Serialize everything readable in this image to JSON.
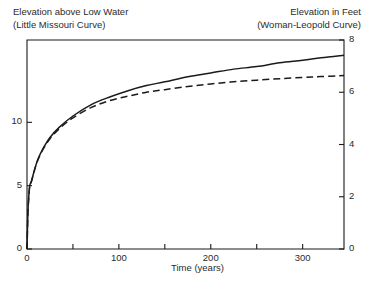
{
  "chart_data": {
    "type": "line",
    "title": "",
    "left_axis_title": "Elevation above Low Water\n(Little Missouri Curve)",
    "right_axis_title": "Elevation in Feet\n(Woman-Leopold Curve)",
    "xlabel": "Time (years)",
    "ylabel_left": "Elevation above Low Water",
    "ylabel_right": "Elevation in Feet",
    "grid": false,
    "legend": "none",
    "xlim": [
      0,
      345
    ],
    "ylim_left": [
      0,
      16.5
    ],
    "ylim_right": [
      0,
      8
    ],
    "xticks": [
      0,
      50,
      100,
      150,
      200,
      250,
      300
    ],
    "xtick_labels": [
      "0",
      "",
      "100",
      "",
      "200",
      "",
      "300"
    ],
    "yticks_left": [
      0,
      5,
      10
    ],
    "ytick_labels_left": [
      "0",
      "5",
      "10"
    ],
    "yticks_right": [
      0,
      2,
      4,
      6,
      8
    ],
    "ytick_labels_right": [
      "0",
      "2",
      "4",
      "6",
      "8"
    ],
    "series": [
      {
        "name": "Little Missouri Curve",
        "style": "solid",
        "axis": "left",
        "x": [
          0,
          1,
          2,
          3,
          5,
          8,
          12,
          18,
          25,
          35,
          50,
          70,
          90,
          110,
          130,
          150,
          175,
          200,
          225,
          250,
          275,
          300,
          320,
          345
        ],
        "values": [
          0,
          2.9,
          4.2,
          5.0,
          5.4,
          6.2,
          7.1,
          8.0,
          8.8,
          9.6,
          10.5,
          11.4,
          12.0,
          12.5,
          12.9,
          13.2,
          13.6,
          13.9,
          14.2,
          14.4,
          14.7,
          14.9,
          15.1,
          15.3
        ]
      },
      {
        "name": "Woman-Leopold Curve",
        "style": "dashed",
        "axis": "right",
        "x": [
          0,
          1,
          2,
          3,
          5,
          8,
          12,
          18,
          25,
          35,
          50,
          70,
          90,
          110,
          130,
          150,
          175,
          200,
          225,
          250,
          275,
          300,
          320,
          345
        ],
        "values": [
          0,
          1.38,
          2.0,
          2.4,
          2.6,
          3.0,
          3.42,
          3.85,
          4.22,
          4.6,
          5.02,
          5.42,
          5.68,
          5.85,
          6.0,
          6.1,
          6.22,
          6.32,
          6.4,
          6.46,
          6.52,
          6.57,
          6.6,
          6.64
        ]
      }
    ],
    "colors": {
      "axis": "#1a1a1a",
      "series_solid": "#1a1a1a",
      "series_dashed": "#1a1a1a",
      "background": "#ffffff"
    }
  }
}
